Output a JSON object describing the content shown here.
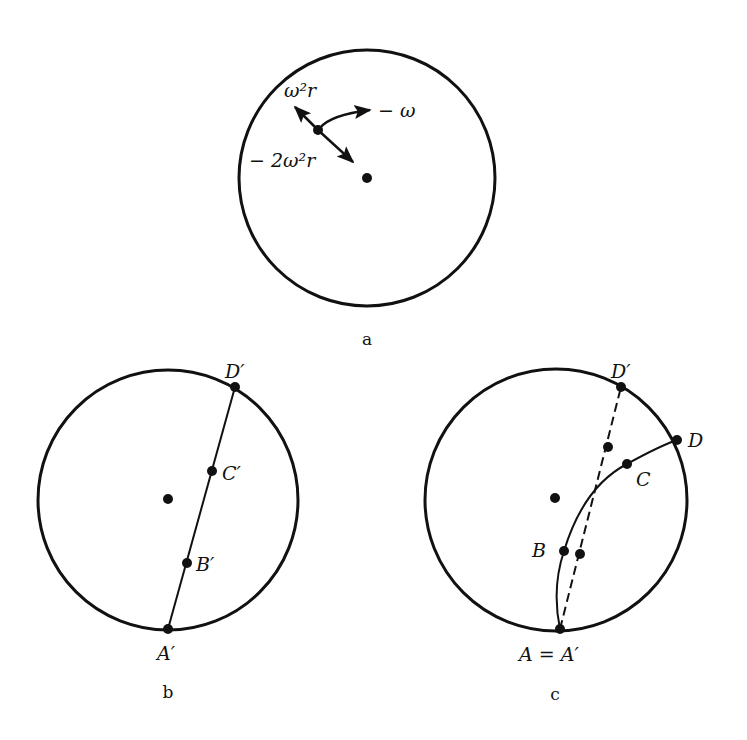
{
  "colors": {
    "ink": "#111111",
    "background": "#ffffff"
  },
  "panels": {
    "a": {
      "caption": "a",
      "circle": {
        "cx": 367,
        "cy": 178,
        "r": 128
      },
      "center_dot": {
        "x": 367,
        "y": 178
      },
      "particle": {
        "x": 318,
        "y": 130
      },
      "labels": {
        "centrifugal": "ω²r",
        "coriolis": "− 2ω²r",
        "rotation": "− ω"
      }
    },
    "b": {
      "caption": "b",
      "circle": {
        "cx": 168,
        "cy": 500,
        "r": 130
      },
      "center_dot": {
        "x": 168,
        "y": 499
      },
      "points": [
        {
          "name": "A′",
          "x": 168,
          "y": 629,
          "lx": 146,
          "ly": 665
        },
        {
          "name": "B′",
          "x": 187,
          "y": 563,
          "lx": 197,
          "ly": 572
        },
        {
          "name": "C′",
          "x": 212,
          "y": 471,
          "lx": 222,
          "ly": 481
        },
        {
          "name": "D′",
          "x": 235,
          "y": 387,
          "lx": 222,
          "ly": 380
        }
      ]
    },
    "c": {
      "caption": "c",
      "circle": {
        "cx": 556,
        "cy": 500,
        "r": 131
      },
      "center_dot": {
        "x": 555,
        "y": 498
      },
      "points": [
        {
          "name": "A = A′",
          "x": 560,
          "y": 629,
          "lx": 520,
          "ly": 665
        },
        {
          "name": "B",
          "x": 564,
          "y": 551,
          "lx": 532,
          "ly": 558
        },
        {
          "name": "C",
          "x": 627,
          "y": 464,
          "lx": 636,
          "ly": 487
        },
        {
          "name": "D",
          "x": 677,
          "y": 440,
          "lx": 688,
          "ly": 448
        },
        {
          "name": "D′",
          "x": 621,
          "y": 387,
          "lx": 618,
          "ly": 380
        }
      ],
      "dashed_points": [
        {
          "x": 608,
          "y": 447
        },
        {
          "x": 580,
          "y": 554
        }
      ]
    }
  }
}
